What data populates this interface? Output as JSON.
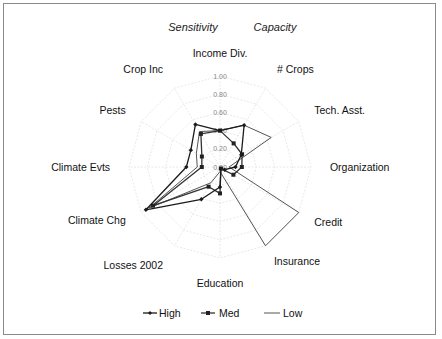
{
  "headers": {
    "left": "Sensitivity",
    "right": "Capacity"
  },
  "chart_data": {
    "type": "radar",
    "title": "",
    "headers": [
      "Sensitivity",
      "Capacity"
    ],
    "categories": [
      "Income Div.",
      "# Crops",
      "Tech. Asst.",
      "Organization",
      "Credit",
      "Insurance",
      "Education",
      "Losses 2002",
      "Climate Chg",
      "Climate Evts",
      "Pests",
      "Crop Inc"
    ],
    "rlim": [
      0,
      1
    ],
    "ticks": [
      "0.00",
      "0.20",
      "0.40",
      "0.60",
      "0.80",
      "1.00"
    ],
    "series": [
      {
        "name": "High",
        "marker": "diamond",
        "values": [
          0.4,
          0.53,
          0.27,
          0.17,
          0.06,
          0.02,
          0.22,
          0.41,
          0.94,
          0.37,
          0.37,
          0.54
        ]
      },
      {
        "name": "Med",
        "marker": "square",
        "values": [
          0.4,
          0.3,
          0.28,
          0.24,
          0.17,
          0.02,
          0.29,
          0.25,
          0.85,
          0.2,
          0.23,
          0.42
        ]
      },
      {
        "name": "Low",
        "marker": "none",
        "values": [
          0.4,
          0.53,
          0.65,
          0.1,
          1.0,
          1.0,
          0.05,
          0.2,
          0.9,
          0.25,
          0.3,
          0.45
        ]
      }
    ],
    "legend_position": "bottom",
    "grid": true
  },
  "legend": {
    "items": [
      {
        "label": "High"
      },
      {
        "label": "Med"
      },
      {
        "label": "Low"
      }
    ]
  },
  "colors": {
    "high": "#1a1a1a",
    "med": "#333333",
    "low": "#555555",
    "grid": "#e2e2e2"
  }
}
